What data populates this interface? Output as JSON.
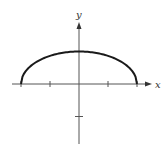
{
  "chart_data": {
    "type": "line",
    "title": "",
    "xlabel": "x",
    "ylabel": "y",
    "equation_hint": "upper half of ellipse x^2/4 + y^2 = 1",
    "series": [
      {
        "name": "y = sqrt(1 - x^2/4)",
        "x": [
          -2,
          -1.75,
          -1.5,
          -1.25,
          -1,
          -0.5,
          0,
          0.5,
          1,
          1.25,
          1.5,
          1.75,
          2
        ],
        "values": [
          0,
          0.484,
          0.661,
          0.781,
          0.866,
          0.968,
          1,
          0.968,
          0.866,
          0.781,
          0.661,
          0.484,
          0
        ]
      }
    ],
    "x_ticks": [
      -2,
      -1,
      1,
      2
    ],
    "y_ticks": [
      -1
    ],
    "tick_labels_shown": false,
    "xlim": [
      -2.6,
      2.9
    ],
    "ylim": [
      -1.9,
      2.5
    ],
    "grid": false,
    "legend": "none",
    "colors": {
      "curve": "#1a1a1a",
      "axes": "#555555"
    }
  },
  "axes": {
    "x_label": "x",
    "y_label": "y"
  }
}
